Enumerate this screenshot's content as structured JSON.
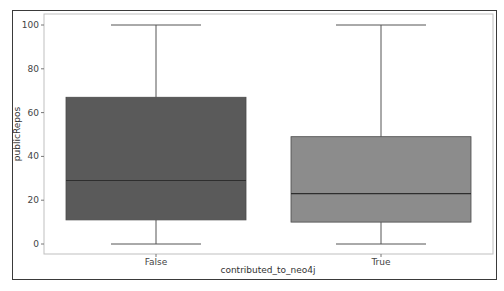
{
  "chart_data": {
    "type": "box",
    "title": "",
    "xlabel": "contributed_to_neo4j",
    "ylabel": "publicRepos",
    "categories": [
      "False",
      "True"
    ],
    "ylim": [
      -5,
      105
    ],
    "yticks": [
      0,
      20,
      40,
      60,
      80,
      100
    ],
    "grid": false,
    "legend": null,
    "series": [
      {
        "name": "False",
        "whisker_low": 0,
        "q1": 11,
        "median": 29,
        "q3": 67,
        "whisker_high": 100,
        "color": "#5a5a5a"
      },
      {
        "name": "True",
        "whisker_low": 0,
        "q1": 10,
        "median": 23,
        "q3": 49,
        "whisker_high": 100,
        "color": "#8c8c8c"
      }
    ]
  },
  "axes": {
    "xlabel": "contributed_to_neo4j",
    "ylabel": "publicRepos",
    "yticks": [
      "0",
      "20",
      "40",
      "60",
      "80",
      "100"
    ],
    "xticks": [
      "False",
      "True"
    ]
  }
}
